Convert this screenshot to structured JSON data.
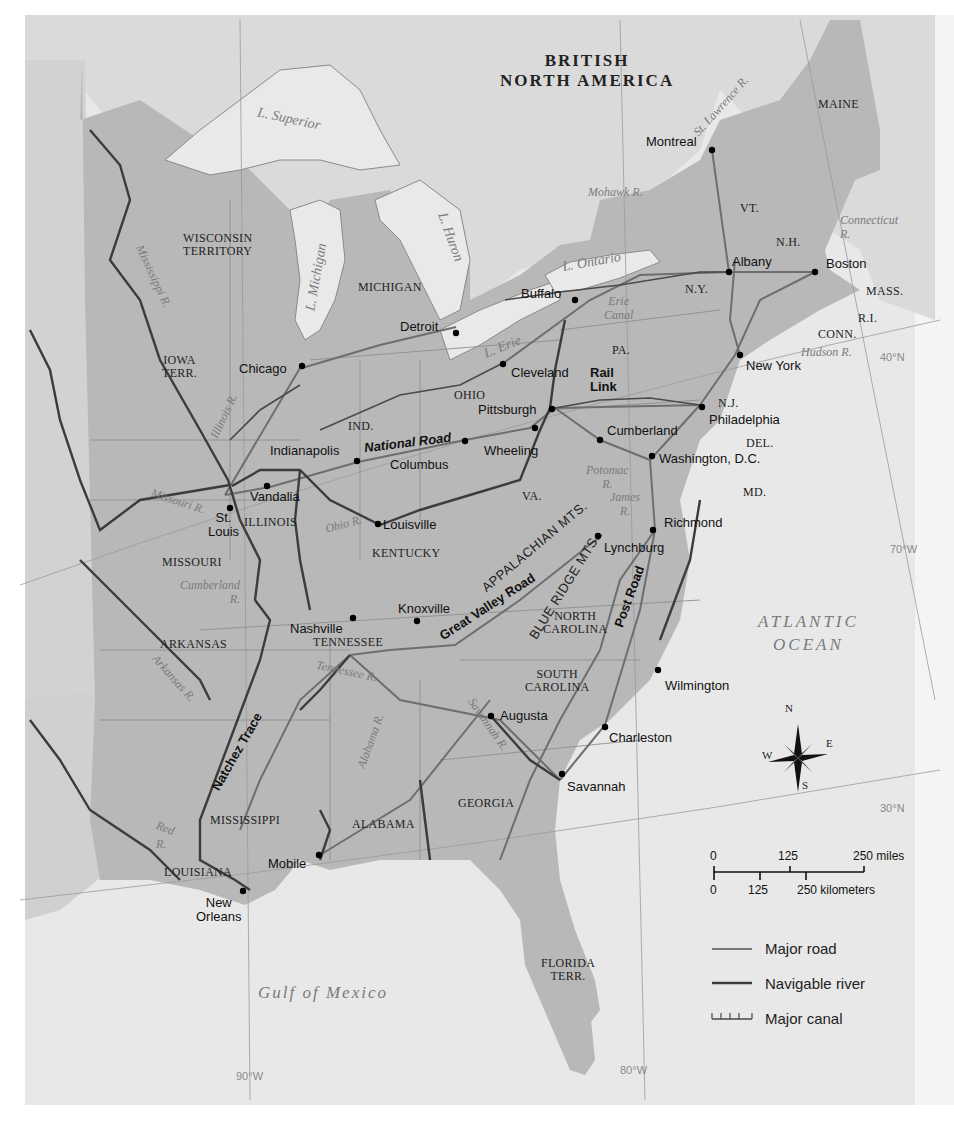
{
  "map": {
    "regions": {
      "british_north_america_line1": "BRITISH",
      "british_north_america_line2": "NORTH AMERICA"
    },
    "states": {
      "maine": "MAINE",
      "vt": "VT.",
      "nh": "N.H.",
      "mass": "MASS.",
      "ri": "R.I.",
      "conn": "CONN.",
      "ny": "N.Y.",
      "pa": "PA.",
      "nj": "N.J.",
      "del": "DEL.",
      "md": "MD.",
      "va": "VA.",
      "ohio": "OHIO",
      "ind": "IND.",
      "michigan": "MICHIGAN",
      "wisconsin_1": "WISCONSIN",
      "wisconsin_2": "TERRITORY",
      "iowa_1": "IOWA",
      "iowa_2": "TERR.",
      "illinois": "ILLINOIS",
      "missouri": "MISSOURI",
      "kentucky": "KENTUCKY",
      "tennessee": "TENNESSEE",
      "north_carolina_1": "NORTH",
      "north_carolina_2": "CAROLINA",
      "south_carolina_1": "SOUTH",
      "south_carolina_2": "CAROLINA",
      "arkansas": "ARKANSAS",
      "mississippi": "MISSISSIPPI",
      "alabama": "ALABAMA",
      "georgia": "GEORGIA",
      "louisiana": "LOUISIANA",
      "florida_1": "FLORIDA",
      "florida_2": "TERR."
    },
    "cities": {
      "montreal": "Montreal",
      "albany": "Albany",
      "boston": "Boston",
      "buffalo": "Buffalo",
      "detroit": "Detroit",
      "chicago": "Chicago",
      "cleveland": "Cleveland",
      "new_york": "New York",
      "pittsburgh": "Pittsburgh",
      "philadelphia": "Philadelphia",
      "cumberland": "Cumberland",
      "wheeling": "Wheeling",
      "columbus": "Columbus",
      "indianapolis": "Indianapolis",
      "washington": "Washington, D.C.",
      "vandalia": "Vandalia",
      "st_louis_1": "St.",
      "st_louis_2": "Louis",
      "louisville": "Louisville",
      "richmond": "Richmond",
      "lynchburg": "Lynchburg",
      "nashville": "Nashville",
      "knoxville": "Knoxville",
      "wilmington": "Wilmington",
      "augusta": "Augusta",
      "charleston": "Charleston",
      "savannah": "Savannah",
      "mobile": "Mobile",
      "new_orleans_1": "New",
      "new_orleans_2": "Orleans"
    },
    "water": {
      "l_superior": "L. Superior",
      "l_michigan": "L. Michigan",
      "l_huron": "L. Huron",
      "l_ontario": "L. Ontario",
      "l_erie": "L. Erie",
      "st_lawrence": "St. Lawrence R.",
      "mohawk": "Mohawk R.",
      "connecticut_1": "Connecticut",
      "connecticut_2": "R.",
      "hudson": "Hudson R.",
      "erie_canal_1": "Erie",
      "erie_canal_2": "Canal",
      "mississippi_r": "Mississippi R.",
      "illinois_r": "Illinois R.",
      "missouri_r": "Missouri R.",
      "ohio_r": "Ohio R.",
      "potomac_1": "Potomac",
      "potomac_2": "R.",
      "james_1": "James",
      "james_2": "R.",
      "cumberland_r_1": "Cumberland",
      "cumberland_r_2": "R.",
      "tennessee_r": "Tennessee R.",
      "arkansas_r": "Arkansas R.",
      "alabama_r": "Alabama R.",
      "savannah_r": "Savannah R.",
      "red_r_1": "Red",
      "red_r_2": "R.",
      "atlantic_1": "ATLANTIC",
      "atlantic_2": "OCEAN",
      "gulf": "Gulf of Mexico"
    },
    "routes": {
      "national_road": "National Road",
      "rail_link_1": "Rail",
      "rail_link_2": "Link",
      "great_valley_road": "Great Valley Road",
      "post_road": "Post Road",
      "natchez_trace": "Natchez Trace"
    },
    "mountains": {
      "appalachian": "APPALACHIAN MTS.",
      "blue_ridge": "BLUE RIDGE MTS."
    },
    "graticule": {
      "lat_40": "40°N",
      "lat_30": "30°N",
      "lon_70": "70°W",
      "lon_80": "80°W",
      "lon_90": "90°W"
    },
    "compass": {
      "n": "N",
      "s": "S",
      "e": "E",
      "w": "W"
    }
  },
  "scale_bar": {
    "miles": [
      "0",
      "125",
      "250 miles"
    ],
    "kilometers": [
      "0",
      "125",
      "250 kilometers"
    ]
  },
  "legend": {
    "items": [
      {
        "label": "Major road",
        "symbol": "thin-line"
      },
      {
        "label": "Navigable river",
        "symbol": "thick-line"
      },
      {
        "label": "Major canal",
        "symbol": "ticked-line"
      }
    ]
  },
  "colors": {
    "land_us": "#b9b9b9",
    "land_foreign": "#dcdcdc",
    "water": "#e9e9e9",
    "road": "#6e6e6e",
    "river": "#3a3a3a",
    "city_dot": "#000000"
  }
}
